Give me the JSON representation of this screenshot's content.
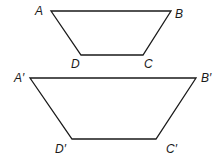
{
  "figure": {
    "trapezoid_small": {
      "labels": {
        "A": "A",
        "B": "B",
        "C": "C",
        "D": "D"
      },
      "points": {
        "A": [
          51,
          11
        ],
        "B": [
          171,
          11
        ],
        "C": [
          143,
          55
        ],
        "D": [
          81,
          55
        ]
      }
    },
    "trapezoid_large": {
      "labels": {
        "A": "A′",
        "B": "B′",
        "C": "C′",
        "D": "D′"
      },
      "points": {
        "A": [
          30,
          78
        ],
        "B": [
          196,
          78
        ],
        "C": [
          156,
          139
        ],
        "D": [
          72,
          139
        ]
      }
    },
    "colors": {
      "stroke": "#1a1a1a",
      "background": "#ffffff"
    }
  }
}
